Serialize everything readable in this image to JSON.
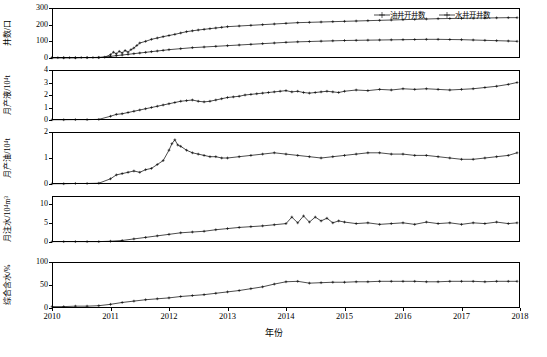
{
  "chart_data": {
    "type": "line",
    "title": "",
    "xlabel": "年份",
    "x_ticks": [
      "2010",
      "2011",
      "2012",
      "2013",
      "2014",
      "2015",
      "2016",
      "2017",
      "2018"
    ],
    "x_range": [
      2010,
      2018
    ],
    "legend": {
      "position": "top-right",
      "entries": [
        {
          "name": "油井开井数",
          "marker": "cross-line"
        },
        {
          "name": "水井开井数",
          "marker": "cross-line"
        }
      ]
    },
    "panels": [
      {
        "id": "well-count",
        "ylabel": "井数/口",
        "y_ticks": [
          0,
          100,
          200,
          300
        ],
        "ylim": [
          0,
          300
        ],
        "series": [
          {
            "name": "油井开井数",
            "x": [
              2010.0,
              2010.1,
              2010.2,
              2010.3,
              2010.4,
              2010.5,
              2010.6,
              2010.7,
              2010.8,
              2010.9,
              2011.0,
              2011.05,
              2011.1,
              2011.15,
              2011.2,
              2011.25,
              2011.3,
              2011.35,
              2011.4,
              2011.45,
              2011.5,
              2011.6,
              2011.7,
              2011.8,
              2011.9,
              2012.0,
              2012.1,
              2012.2,
              2012.3,
              2012.4,
              2012.5,
              2012.6,
              2012.7,
              2012.8,
              2012.9,
              2013.0,
              2013.2,
              2013.4,
              2013.6,
              2013.8,
              2014.0,
              2014.2,
              2014.4,
              2014.6,
              2014.8,
              2015.0,
              2015.2,
              2015.4,
              2015.6,
              2015.8,
              2016.0,
              2016.2,
              2016.4,
              2016.6,
              2016.8,
              2017.0,
              2017.2,
              2017.4,
              2017.6,
              2017.8,
              2017.95
            ],
            "y": [
              2,
              2,
              2,
              2,
              2,
              3,
              3,
              3,
              4,
              5,
              20,
              35,
              25,
              40,
              30,
              45,
              35,
              50,
              60,
              75,
              90,
              100,
              112,
              120,
              128,
              135,
              142,
              150,
              158,
              163,
              168,
              172,
              176,
              180,
              184,
              188,
              192,
              196,
              200,
              204,
              208,
              212,
              214,
              216,
              218,
              220,
              222,
              224,
              226,
              228,
              230,
              232,
              234,
              236,
              237,
              238,
              239,
              240,
              241,
              242,
              242
            ]
          },
          {
            "name": "水井开井数",
            "x": [
              2010.0,
              2010.2,
              2010.4,
              2010.6,
              2010.8,
              2011.0,
              2011.1,
              2011.2,
              2011.3,
              2011.4,
              2011.5,
              2011.6,
              2011.7,
              2011.8,
              2011.9,
              2012.0,
              2012.2,
              2012.4,
              2012.6,
              2012.8,
              2013.0,
              2013.2,
              2013.4,
              2013.6,
              2013.8,
              2014.0,
              2014.2,
              2014.4,
              2014.6,
              2014.8,
              2015.0,
              2015.2,
              2015.4,
              2015.6,
              2015.8,
              2016.0,
              2016.2,
              2016.4,
              2016.6,
              2016.8,
              2017.0,
              2017.2,
              2017.4,
              2017.6,
              2017.8,
              2017.95
            ],
            "y": [
              1,
              1,
              1,
              2,
              2,
              10,
              14,
              18,
              22,
              26,
              30,
              34,
              38,
              42,
              46,
              50,
              56,
              62,
              66,
              70,
              74,
              78,
              82,
              86,
              90,
              94,
              97,
              99,
              101,
              103,
              105,
              106,
              107,
              108,
              109,
              110,
              111,
              112,
              112,
              111,
              110,
              108,
              106,
              104,
              102,
              100
            ]
          }
        ]
      },
      {
        "id": "monthly-liquid",
        "ylabel": "月产液/10⁴t",
        "y_ticks": [
          0,
          1,
          2,
          3,
          4
        ],
        "ylim": [
          0,
          4
        ],
        "series": [
          {
            "name": "月产液",
            "x": [
              2010.0,
              2010.2,
              2010.4,
              2010.6,
              2010.8,
              2011.0,
              2011.1,
              2011.2,
              2011.3,
              2011.4,
              2011.5,
              2011.6,
              2011.7,
              2011.8,
              2011.9,
              2012.0,
              2012.1,
              2012.2,
              2012.3,
              2012.4,
              2012.5,
              2012.6,
              2012.7,
              2012.8,
              2012.9,
              2013.0,
              2013.1,
              2013.2,
              2013.3,
              2013.4,
              2013.5,
              2013.6,
              2013.7,
              2013.8,
              2013.9,
              2014.0,
              2014.1,
              2014.2,
              2014.3,
              2014.4,
              2014.5,
              2014.6,
              2014.7,
              2014.8,
              2014.9,
              2015.0,
              2015.2,
              2015.4,
              2015.6,
              2015.8,
              2016.0,
              2016.2,
              2016.4,
              2016.6,
              2016.8,
              2017.0,
              2017.2,
              2017.4,
              2017.6,
              2017.8,
              2017.95
            ],
            "y": [
              0.02,
              0.02,
              0.03,
              0.03,
              0.05,
              0.3,
              0.45,
              0.5,
              0.6,
              0.7,
              0.8,
              0.9,
              1.0,
              1.1,
              1.2,
              1.3,
              1.4,
              1.5,
              1.55,
              1.6,
              1.5,
              1.45,
              1.5,
              1.6,
              1.7,
              1.8,
              1.85,
              1.9,
              2.0,
              2.05,
              2.1,
              2.15,
              2.2,
              2.25,
              2.3,
              2.35,
              2.25,
              2.3,
              2.2,
              2.15,
              2.2,
              2.25,
              2.3,
              2.25,
              2.2,
              2.3,
              2.4,
              2.35,
              2.45,
              2.4,
              2.5,
              2.45,
              2.5,
              2.45,
              2.4,
              2.45,
              2.5,
              2.6,
              2.7,
              2.85,
              3.0
            ]
          }
        ]
      },
      {
        "id": "monthly-oil",
        "ylabel": "月产油/10⁴t",
        "y_ticks": [
          0,
          1,
          2
        ],
        "ylim": [
          0,
          2
        ],
        "series": [
          {
            "name": "月产油",
            "x": [
              2010.0,
              2010.2,
              2010.4,
              2010.6,
              2010.8,
              2011.0,
              2011.1,
              2011.2,
              2011.3,
              2011.4,
              2011.5,
              2011.6,
              2011.7,
              2011.8,
              2011.9,
              2012.0,
              2012.05,
              2012.1,
              2012.15,
              2012.2,
              2012.3,
              2012.4,
              2012.5,
              2012.6,
              2012.7,
              2012.8,
              2012.9,
              2013.0,
              2013.2,
              2013.4,
              2013.6,
              2013.8,
              2014.0,
              2014.2,
              2014.4,
              2014.6,
              2014.8,
              2015.0,
              2015.2,
              2015.4,
              2015.6,
              2015.8,
              2016.0,
              2016.2,
              2016.4,
              2016.6,
              2016.8,
              2017.0,
              2017.2,
              2017.4,
              2017.6,
              2017.8,
              2017.95
            ],
            "y": [
              0.01,
              0.01,
              0.02,
              0.02,
              0.03,
              0.2,
              0.35,
              0.4,
              0.45,
              0.5,
              0.45,
              0.55,
              0.6,
              0.75,
              0.9,
              1.3,
              1.55,
              1.7,
              1.5,
              1.45,
              1.3,
              1.2,
              1.15,
              1.1,
              1.05,
              1.05,
              1.0,
              1.0,
              1.05,
              1.1,
              1.15,
              1.2,
              1.15,
              1.1,
              1.05,
              1.0,
              1.05,
              1.1,
              1.15,
              1.2,
              1.2,
              1.15,
              1.15,
              1.1,
              1.1,
              1.05,
              1.0,
              0.95,
              0.95,
              1.0,
              1.05,
              1.1,
              1.2
            ]
          }
        ]
      },
      {
        "id": "monthly-injection",
        "ylabel": "月注水/10⁴m³",
        "y_ticks": [
          0,
          5,
          10
        ],
        "ylim": [
          0,
          12
        ],
        "series": [
          {
            "name": "月注水",
            "x": [
              2010.0,
              2010.2,
              2010.4,
              2010.6,
              2010.8,
              2011.0,
              2011.2,
              2011.4,
              2011.6,
              2011.8,
              2012.0,
              2012.2,
              2012.4,
              2012.6,
              2012.8,
              2013.0,
              2013.2,
              2013.4,
              2013.6,
              2013.8,
              2014.0,
              2014.1,
              2014.2,
              2014.3,
              2014.4,
              2014.5,
              2014.6,
              2014.7,
              2014.8,
              2014.9,
              2015.0,
              2015.2,
              2015.4,
              2015.6,
              2015.8,
              2016.0,
              2016.2,
              2016.4,
              2016.6,
              2016.8,
              2017.0,
              2017.2,
              2017.4,
              2017.6,
              2017.8,
              2017.95
            ],
            "y": [
              0.1,
              0.1,
              0.1,
              0.1,
              0.1,
              0.2,
              0.4,
              0.8,
              1.2,
              1.6,
              2.0,
              2.4,
              2.6,
              2.8,
              3.2,
              3.5,
              3.8,
              4.0,
              4.2,
              4.5,
              4.8,
              6.5,
              5.0,
              6.8,
              5.2,
              6.5,
              5.5,
              6.2,
              5.0,
              5.5,
              5.2,
              4.8,
              5.0,
              4.6,
              4.8,
              5.0,
              4.6,
              5.2,
              4.8,
              5.0,
              4.6,
              5.0,
              4.8,
              5.2,
              4.8,
              5.0
            ]
          }
        ]
      },
      {
        "id": "water-cut",
        "ylabel": "综合含水/%",
        "y_ticks": [
          0,
          50,
          100
        ],
        "ylim": [
          0,
          100
        ],
        "series": [
          {
            "name": "综合含水",
            "x": [
              2010.0,
              2010.2,
              2010.4,
              2010.6,
              2010.8,
              2011.0,
              2011.2,
              2011.4,
              2011.6,
              2011.8,
              2012.0,
              2012.2,
              2012.4,
              2012.6,
              2012.8,
              2013.0,
              2013.2,
              2013.4,
              2013.6,
              2013.8,
              2014.0,
              2014.2,
              2014.4,
              2014.6,
              2014.8,
              2015.0,
              2015.2,
              2015.4,
              2015.6,
              2015.8,
              2016.0,
              2016.2,
              2016.4,
              2016.6,
              2016.8,
              2017.0,
              2017.2,
              2017.4,
              2017.6,
              2017.8,
              2017.95
            ],
            "y": [
              3,
              3,
              4,
              4,
              5,
              8,
              12,
              15,
              18,
              20,
              22,
              25,
              27,
              29,
              32,
              35,
              38,
              42,
              46,
              52,
              57,
              58,
              54,
              55,
              56,
              56,
              57,
              57,
              58,
              58,
              58,
              58,
              57,
              57,
              58,
              58,
              58,
              57,
              58,
              58,
              58
            ]
          }
        ]
      }
    ]
  }
}
